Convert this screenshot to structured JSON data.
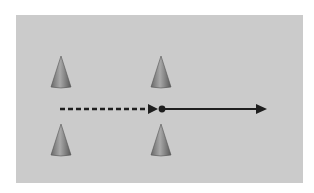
{
  "diagram": {
    "type": "drill-field",
    "background_color": "#cbcbcb",
    "cones": [
      {
        "id": "cone-top-left",
        "row": "top",
        "column": "left"
      },
      {
        "id": "cone-top-right",
        "row": "top",
        "column": "right"
      },
      {
        "id": "cone-bottom-left",
        "row": "bottom",
        "column": "left"
      },
      {
        "id": "cone-bottom-right",
        "row": "bottom",
        "column": "right"
      }
    ],
    "paths": [
      {
        "id": "dashed-path",
        "style": "dashed",
        "from": "left-cones",
        "to": "right-cones"
      },
      {
        "id": "solid-path",
        "style": "solid",
        "from": "right-cones",
        "to": "end"
      }
    ],
    "markers": [
      {
        "id": "waypoint-dot",
        "at": "right-cones"
      }
    ],
    "colors": {
      "cone_light": "#9a9a9a",
      "cone_dark": "#5a5a5a",
      "arrow": "#1e1e1e"
    }
  }
}
